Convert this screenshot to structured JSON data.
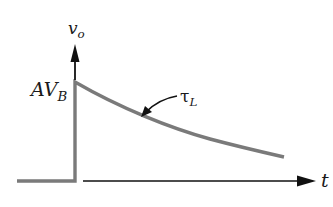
{
  "diagram": {
    "title": "",
    "type": "waveform-exponential-decay",
    "colors": {
      "waveform": "#7a7a7a",
      "axes": "#111111",
      "text": "#1a1a1a"
    },
    "labels": {
      "y_axis": {
        "main": "v",
        "sub": "o"
      },
      "peak": {
        "main": "AV",
        "sub": "B"
      },
      "time_constant": {
        "main": "τ",
        "sub": "L"
      },
      "x_axis": "t"
    }
  }
}
